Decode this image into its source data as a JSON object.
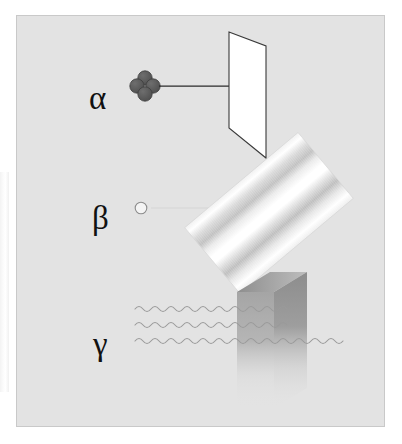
{
  "figure": {
    "background_color": "#e3e3e3",
    "border_color": "#c9c9c9",
    "page_color": "#ffffff"
  },
  "rows": [
    {
      "id": "alpha",
      "label": "α",
      "label_name": "alpha",
      "emitter_icon": "alpha-particle-icon",
      "emitter_description": "four dark circles clustered (helium nucleus)",
      "emitter_color": "#595959",
      "ray_icon": "straight-arrow-icon",
      "ray_color": "#2b2b2b",
      "barrier_icon": "paper-sheet-icon",
      "barrier_label": "sheet of paper",
      "barrier_fill": "#ffffff",
      "barrier_stroke": "#3a3a3a",
      "stopped_by_barrier": true
    },
    {
      "id": "beta",
      "label": "β",
      "label_name": "beta",
      "emitter_icon": "beta-particle-icon",
      "emitter_description": "small open circle (electron)",
      "emitter_color": "#f2f2f2",
      "emitter_stroke": "#8a8a8a",
      "ray_icon": "thin-line-icon",
      "ray_color": "#d2d2d2",
      "barrier_icon": "metal-plate-icon",
      "barrier_label": "metal plate",
      "barrier_fill": "#f6f6f6",
      "barrier_stroke": "#cfcfcf",
      "stopped_by_barrier": true
    },
    {
      "id": "gamma",
      "label": "γ",
      "label_name": "gamma",
      "emitter_icon": "gamma-wave-icon",
      "emitter_description": "three horizontal sine waves",
      "emitter_color": "#9a9a9a",
      "ray_icon": "sine-wave-icon",
      "ray_color": "#9a9a9a",
      "barrier_icon": "concrete-block-icon",
      "barrier_label": "concrete block",
      "barrier_fill": "#a9a9a9",
      "barrier_stroke": "#8f8f8f",
      "stopped_by_barrier": false
    }
  ],
  "waves": {
    "count": 3,
    "y_positions": [
      293,
      309,
      325
    ],
    "amplitude": 4,
    "wavelength": 16,
    "x_start": [
      118,
      118,
      118
    ],
    "x_end": [
      275,
      275,
      330
    ],
    "color": "#9a9a9a"
  },
  "alpha_particle": {
    "circle_count": 4,
    "center_x": 128,
    "center_y": 69,
    "radius": 7,
    "fill": "#595959",
    "stroke": "#3f3f3f"
  },
  "beta_particle": {
    "center_x": 124,
    "center_y": 192,
    "radius": 6,
    "fill": "#f4f4f4",
    "stroke": "#8d8d8d"
  },
  "paper_sheet": {
    "points": "212,15 245,28 245,140 212,108",
    "fill": "#ffffff",
    "stroke": "#3a3a3a"
  },
  "metal_plate": {
    "center_x": 252,
    "center_y": 197,
    "width": 148,
    "height": 86,
    "rotation_deg": -40,
    "sheen_colors": [
      "#ffffff",
      "#d4d4d4",
      "#fcfcfc",
      "#c4c4c4",
      "#ffffff"
    ]
  },
  "concrete_block": {
    "front_face": "254,260 289,260 289,372 254,372",
    "top_face": "220,278 254,260 289,260 254,278",
    "left_face": "220,278 254,260 254,372 220,390",
    "fill_top": "#9d9d9d",
    "fill_left": "#b4b4b4",
    "fill_front": "#9a9a9a"
  }
}
